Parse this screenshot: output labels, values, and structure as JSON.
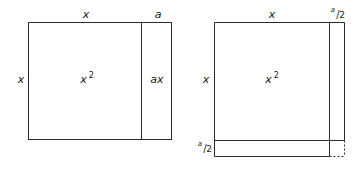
{
  "left_figure": {
    "top_labels": {
      "x": "x",
      "a": "a"
    },
    "side_label": "x",
    "big_area": {
      "base": "x",
      "exp": "2"
    },
    "strip_area": "ax"
  },
  "right_figure": {
    "top_labels": {
      "x": "x",
      "half_a": {
        "num": "a",
        "den": "2"
      }
    },
    "side_label": "x",
    "big_area": {
      "base": "x",
      "exp": "2"
    },
    "bottom_label": {
      "num": "a",
      "den": "2"
    }
  },
  "colors": {
    "line": "#2a2a2a",
    "text": "#1a1a1a",
    "background": "#ffffff"
  }
}
